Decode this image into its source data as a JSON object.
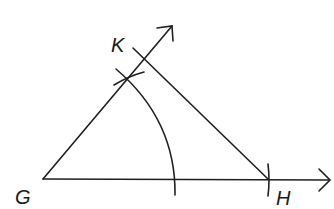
{
  "diagram": {
    "type": "geometric-construction",
    "stroke_color": "#1f1f1f",
    "background": "#ffffff",
    "points": {
      "G": {
        "label": "G",
        "x": 43,
        "y": 179
      },
      "H": {
        "label": "H",
        "x": 268,
        "y": 179
      },
      "K": {
        "label": "K",
        "x": 145,
        "y": 57
      }
    },
    "labels": [
      {
        "text": "G",
        "x": 15,
        "y": 204
      },
      {
        "text": "H",
        "x": 276,
        "y": 205
      },
      {
        "text": "K",
        "x": 111,
        "y": 52
      }
    ],
    "rays": [
      {
        "name": "ray-GH",
        "from": "G",
        "direction": "through H",
        "arrow_end": [
          330,
          180
        ]
      },
      {
        "name": "ray-GK",
        "from": "G",
        "direction": "up-right",
        "arrow_end": [
          172,
          26
        ]
      }
    ],
    "segments": [
      {
        "name": "segment-HK",
        "from": [
          268,
          179
        ],
        "to": [
          133,
          48
        ]
      }
    ],
    "arcs": [
      {
        "name": "compass-arc",
        "center": "G",
        "description": "large arc from near ray GK down across GH"
      },
      {
        "name": "cross-arc-mark",
        "description": "short arc crossing ray GK"
      }
    ],
    "ticks": [
      {
        "name": "tick-mark-H",
        "at": "H",
        "description": "short vertical arc mark on ray GH at H"
      }
    ]
  }
}
